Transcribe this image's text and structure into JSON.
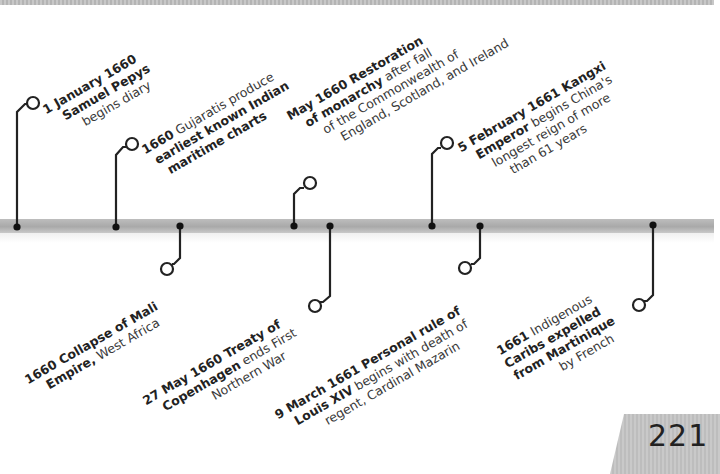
{
  "page": {
    "number": "221",
    "colors": {
      "background": "#ffffff",
      "timeline_bar": "#b0b0b0",
      "connector": "#222222",
      "text": "#3a3a3a",
      "page_tab": "#c4c4c4"
    }
  },
  "timeline": {
    "events_above": [
      {
        "id": "pepys",
        "lines": [
          {
            "bold": "1 January 1660",
            "normal": ""
          },
          {
            "bold": "Samuel Pepys",
            "normal": ""
          },
          {
            "bold": "",
            "normal": "begins diary"
          }
        ]
      },
      {
        "id": "gujaratis",
        "lines": [
          {
            "bold": "1660",
            "normal": " Gujaratis produce"
          },
          {
            "bold": "earliest known Indian",
            "normal": ""
          },
          {
            "bold": "maritime charts",
            "normal": ""
          }
        ]
      },
      {
        "id": "restoration",
        "lines": [
          {
            "bold": "May 1660 Restoration",
            "normal": ""
          },
          {
            "bold": "of monarchy",
            "normal": " after fall"
          },
          {
            "bold": "",
            "normal": "of the Commonwealth of"
          },
          {
            "bold": "",
            "normal": "England, Scotland, and Ireland"
          }
        ]
      },
      {
        "id": "kangxi",
        "lines": [
          {
            "bold": "5 February 1661 Kangxi",
            "normal": ""
          },
          {
            "bold": "Emperor",
            "normal": " begins China's"
          },
          {
            "bold": "",
            "normal": "longest reign of more"
          },
          {
            "bold": "",
            "normal": "than 61 years"
          }
        ]
      }
    ],
    "events_below": [
      {
        "id": "mali",
        "lines": [
          {
            "bold": "1660 Collapse of Mali",
            "normal": ""
          },
          {
            "bold": "Empire,",
            "normal": " West Africa"
          }
        ]
      },
      {
        "id": "copenhagen",
        "lines": [
          {
            "bold": "27 May 1660 Treaty of",
            "normal": ""
          },
          {
            "bold": "Copenhagen",
            "normal": " ends First"
          },
          {
            "bold": "",
            "normal": "Northern War"
          }
        ]
      },
      {
        "id": "louis",
        "lines": [
          {
            "bold": "9 March 1661 Personal rule of",
            "normal": ""
          },
          {
            "bold": "Louis XIV",
            "normal": " begins with death of"
          },
          {
            "bold": "",
            "normal": "regent, Cardinal Mazarin"
          }
        ]
      },
      {
        "id": "caribs",
        "lines": [
          {
            "bold": "1661",
            "normal": " Indigenous"
          },
          {
            "bold": "Caribs expelled",
            "normal": ""
          },
          {
            "bold": "from Martinique",
            "normal": ""
          },
          {
            "bold": "",
            "normal": "by French"
          }
        ]
      }
    ]
  }
}
